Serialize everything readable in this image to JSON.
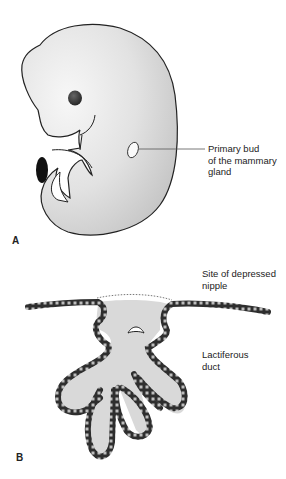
{
  "figure": {
    "panels": [
      {
        "id": "A",
        "letter": "A",
        "subject": "embryo",
        "labels": [
          {
            "id": "primary-bud",
            "text": "Primary bud\nof the mammary\ngland"
          }
        ]
      },
      {
        "id": "B",
        "letter": "B",
        "subject": "lactiferous duct cross-section",
        "labels": [
          {
            "id": "depressed-nipple",
            "text": "Site of depressed\nnipple"
          },
          {
            "id": "lactiferous-duct",
            "text": "Lactiferous\nduct"
          }
        ]
      }
    ],
    "colors": {
      "embryo_fill_light": "#f4f4f4",
      "embryo_fill_dark": "#c9c9c9",
      "outline": "#222222",
      "duct_fill": "#d9d9d9",
      "epithelium": "#2e2e2e",
      "leader_line": "#555555"
    }
  }
}
